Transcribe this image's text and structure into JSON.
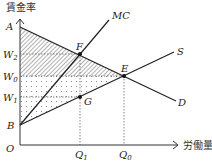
{
  "axes": {
    "y_label": "賃金率",
    "x_label": "労働量",
    "origin": "O"
  },
  "y_ticks": [
    {
      "name": "A",
      "sub": ""
    },
    {
      "name": "W",
      "sub": "2"
    },
    {
      "name": "W",
      "sub": "0"
    },
    {
      "name": "W",
      "sub": "1"
    },
    {
      "name": "B",
      "sub": ""
    }
  ],
  "x_ticks": [
    {
      "name": "Q",
      "sub": "1"
    },
    {
      "name": "Q",
      "sub": "0"
    }
  ],
  "curves": {
    "mc": "MC",
    "s": "S",
    "d": "D"
  },
  "points": {
    "f": "F",
    "e": "E",
    "g": "G"
  }
}
